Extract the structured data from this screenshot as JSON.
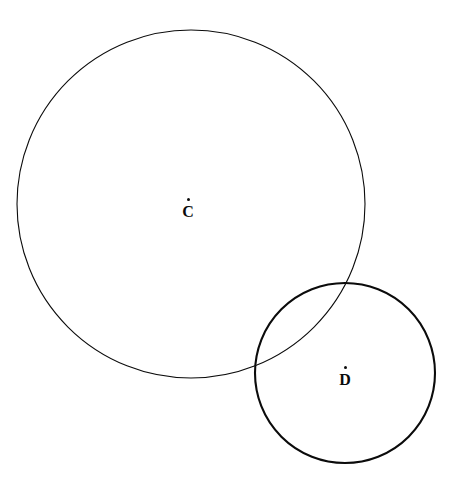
{
  "figure": {
    "background_color": "#ffffff",
    "stroke_color": "#0b0b0b",
    "width": 459,
    "height": 501
  },
  "labels": {
    "circle_c": {
      "letter": "C",
      "center_marker": "center-point-dot"
    },
    "circle_d": {
      "letter": "D",
      "center_marker": "center-point-dot"
    }
  },
  "chart_data": {
    "type": "scatter",
    "title": "",
    "xlabel": "",
    "ylabel": "",
    "grid": false,
    "legend": "none",
    "xlim": [
      0,
      459
    ],
    "ylim": [
      0,
      501
    ],
    "shapes": [
      {
        "name": "circle-c",
        "kind": "circle",
        "label": "C",
        "cx": 191,
        "cy": 204,
        "r": 174,
        "stroke": "#0b0b0b",
        "stroke_width": 1.1,
        "fill": "none"
      },
      {
        "name": "circle-d",
        "kind": "circle",
        "label": "D",
        "cx": 345,
        "cy": 373,
        "r": 90,
        "stroke": "#0b0b0b",
        "stroke_width": 2.1,
        "fill": "none"
      }
    ],
    "points": [
      {
        "name": "center-c",
        "label": "C",
        "x": 191,
        "y": 204
      },
      {
        "name": "center-d",
        "label": "D",
        "x": 345,
        "y": 373
      }
    ],
    "relationships": [
      "circle C and circle D intersect at two points",
      "center distance is less than the sum of the radii"
    ]
  }
}
